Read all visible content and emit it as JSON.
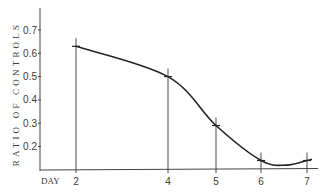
{
  "chart_data": {
    "type": "line",
    "title": "",
    "xlabel": "DAY",
    "ylabel": "RATIO OF CONTROLS",
    "x": [
      2,
      4,
      5,
      6,
      7
    ],
    "x_tick_labels": [
      "2",
      "4",
      "5",
      "6",
      "7"
    ],
    "y_ticks": [
      0.2,
      0.3,
      0.4,
      0.5,
      0.6,
      0.7
    ],
    "y_tick_labels": [
      "0.2",
      "0.3",
      "0.4",
      "0.5",
      "0.6",
      "0.7"
    ],
    "series": [
      {
        "name": "Ratio of controls",
        "x": [
          2,
          4,
          5,
          6,
          7
        ],
        "values": [
          0.63,
          0.5,
          0.29,
          0.14,
          0.14
        ],
        "smooth_curve_minimum": {
          "x": 6.55,
          "y": 0.12
        }
      }
    ],
    "ylim": [
      0.1,
      0.78
    ],
    "xlim": [
      0.8,
      7.2
    ],
    "grid": false,
    "legend": "none",
    "markers": "cross ticks with vertical drop lines to x-axis",
    "colors": {
      "line": "#222222",
      "axis": "#444444",
      "text": "#3a3a3a"
    }
  }
}
